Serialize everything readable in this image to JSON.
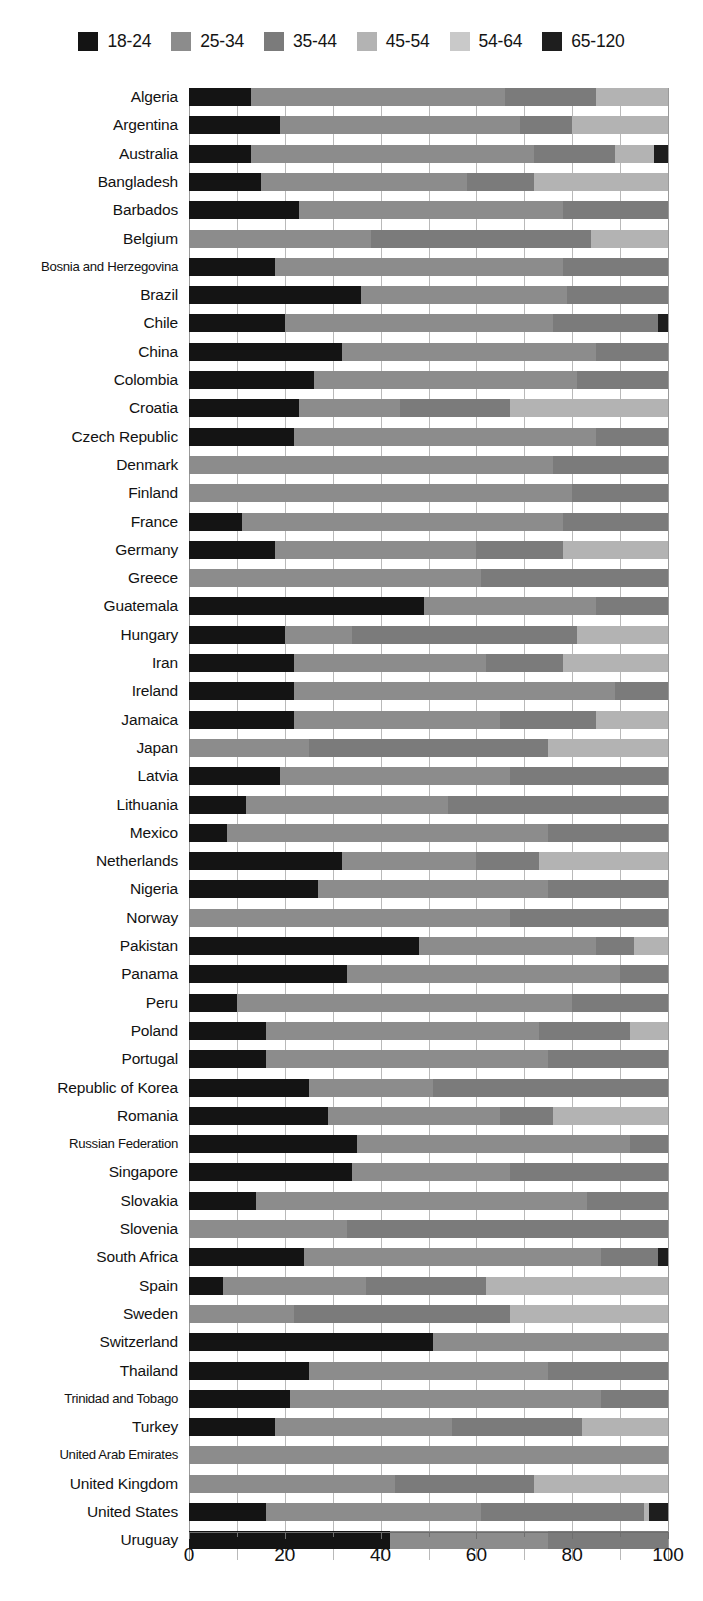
{
  "legend": {
    "position": "top-center",
    "entries": [
      {
        "label": "18-24",
        "color": "#141414",
        "icon": "legend-swatch-icon"
      },
      {
        "label": "25-34",
        "color": "#8c8c8c",
        "icon": "legend-swatch-icon"
      },
      {
        "label": "35-44",
        "color": "#7b7b7b",
        "icon": "legend-swatch-icon"
      },
      {
        "label": "45-54",
        "color": "#b3b3b3",
        "icon": "legend-swatch-icon"
      },
      {
        "label": "54-64",
        "color": "#c9c9c9",
        "icon": "legend-swatch-icon"
      },
      {
        "label": "65-120",
        "color": "#1e1e1e",
        "icon": "legend-swatch-icon"
      }
    ]
  },
  "axis": {
    "x_ticks": [
      "0",
      "20",
      "40",
      "60",
      "80",
      "100"
    ],
    "x_tick_values": [
      0,
      20,
      40,
      60,
      80,
      100
    ],
    "x_minor_values": [
      10,
      30,
      50,
      70,
      90
    ],
    "xlim": [
      0,
      100
    ],
    "xlabel": "",
    "ylabel": ""
  },
  "chart_data": {
    "type": "bar",
    "orientation": "horizontal",
    "stacked": true,
    "normalized": true,
    "title": "",
    "subtitle": "",
    "xlabel": "",
    "ylabel": "",
    "xlim": [
      0,
      100
    ],
    "grid": "vertical-minor-and-major",
    "legend_position": "top-center",
    "series": [
      {
        "name": "18-24",
        "color": "#141414"
      },
      {
        "name": "25-34",
        "color": "#8c8c8c"
      },
      {
        "name": "35-44",
        "color": "#7b7b7b"
      },
      {
        "name": "45-54",
        "color": "#b3b3b3"
      },
      {
        "name": "54-64",
        "color": "#c9c9c9"
      },
      {
        "name": "65-120",
        "color": "#1e1e1e"
      }
    ],
    "categories": [
      "Algeria",
      "Argentina",
      "Australia",
      "Bangladesh",
      "Barbados",
      "Belgium",
      "Bosnia and Herzegovina",
      "Brazil",
      "Chile",
      "China",
      "Colombia",
      "Croatia",
      "Czech Republic",
      "Denmark",
      "Finland",
      "France",
      "Germany",
      "Greece",
      "Guatemala",
      "Hungary",
      "Iran",
      "Ireland",
      "Jamaica",
      "Japan",
      "Latvia",
      "Lithuania",
      "Mexico",
      "Netherlands",
      "Nigeria",
      "Norway",
      "Pakistan",
      "Panama",
      "Peru",
      "Poland",
      "Portugal",
      "Republic of Korea",
      "Romania",
      "Russian Federation",
      "Singapore",
      "Slovakia",
      "Slovenia",
      "South Africa",
      "Spain",
      "Sweden",
      "Switzerland",
      "Thailand",
      "Trinidad and Tobago",
      "Turkey",
      "United Arab Emirates",
      "United Kingdom",
      "United States",
      "Uruguay"
    ],
    "rows": [
      {
        "category": "Algeria",
        "values": [
          13,
          53,
          19,
          15,
          0,
          0
        ]
      },
      {
        "category": "Argentina",
        "values": [
          19,
          50,
          11,
          20,
          0,
          0
        ]
      },
      {
        "category": "Australia",
        "values": [
          13,
          59,
          17,
          8,
          0,
          3
        ]
      },
      {
        "category": "Bangladesh",
        "values": [
          15,
          43,
          14,
          28,
          0,
          0
        ]
      },
      {
        "category": "Barbados",
        "values": [
          23,
          55,
          22,
          0,
          0,
          0
        ]
      },
      {
        "category": "Belgium",
        "values": [
          0,
          38,
          46,
          16,
          0,
          0
        ]
      },
      {
        "category": "Bosnia and Herzegovina",
        "values": [
          18,
          60,
          22,
          0,
          0,
          0
        ]
      },
      {
        "category": "Brazil",
        "values": [
          36,
          43,
          21,
          0,
          0,
          0
        ]
      },
      {
        "category": "Chile",
        "values": [
          20,
          56,
          22,
          0,
          0,
          2
        ]
      },
      {
        "category": "China",
        "values": [
          32,
          53,
          15,
          0,
          0,
          0
        ]
      },
      {
        "category": "Colombia",
        "values": [
          26,
          55,
          19,
          0,
          0,
          0
        ]
      },
      {
        "category": "Croatia",
        "values": [
          23,
          21,
          23,
          33,
          0,
          0
        ]
      },
      {
        "category": "Czech Republic",
        "values": [
          22,
          63,
          15,
          0,
          0,
          0
        ]
      },
      {
        "category": "Denmark",
        "values": [
          0,
          76,
          24,
          0,
          0,
          0
        ]
      },
      {
        "category": "Finland",
        "values": [
          0,
          80,
          20,
          0,
          0,
          0
        ]
      },
      {
        "category": "France",
        "values": [
          11,
          67,
          22,
          0,
          0,
          0
        ]
      },
      {
        "category": "Germany",
        "values": [
          18,
          42,
          18,
          22,
          0,
          0
        ]
      },
      {
        "category": "Greece",
        "values": [
          0,
          61,
          39,
          0,
          0,
          0
        ]
      },
      {
        "category": "Guatemala",
        "values": [
          49,
          36,
          15,
          0,
          0,
          0
        ]
      },
      {
        "category": "Hungary",
        "values": [
          20,
          14,
          47,
          19,
          0,
          0
        ]
      },
      {
        "category": "Iran",
        "values": [
          22,
          40,
          16,
          22,
          0,
          0
        ]
      },
      {
        "category": "Ireland",
        "values": [
          22,
          67,
          11,
          0,
          0,
          0
        ]
      },
      {
        "category": "Jamaica",
        "values": [
          22,
          43,
          20,
          15,
          0,
          0
        ]
      },
      {
        "category": "Japan",
        "values": [
          0,
          25,
          50,
          25,
          0,
          0
        ]
      },
      {
        "category": "Latvia",
        "values": [
          19,
          48,
          33,
          0,
          0,
          0
        ]
      },
      {
        "category": "Lithuania",
        "values": [
          12,
          42,
          46,
          0,
          0,
          0
        ]
      },
      {
        "category": "Mexico",
        "values": [
          8,
          67,
          25,
          0,
          0,
          0
        ]
      },
      {
        "category": "Netherlands",
        "values": [
          32,
          28,
          13,
          27,
          0,
          0
        ]
      },
      {
        "category": "Nigeria",
        "values": [
          27,
          48,
          25,
          0,
          0,
          0
        ]
      },
      {
        "category": "Norway",
        "values": [
          0,
          67,
          33,
          0,
          0,
          0
        ]
      },
      {
        "category": "Pakistan",
        "values": [
          48,
          37,
          8,
          7,
          0,
          0
        ]
      },
      {
        "category": "Panama",
        "values": [
          33,
          57,
          10,
          0,
          0,
          0
        ]
      },
      {
        "category": "Peru",
        "values": [
          10,
          70,
          20,
          0,
          0,
          0
        ]
      },
      {
        "category": "Poland",
        "values": [
          16,
          57,
          19,
          8,
          0,
          0
        ]
      },
      {
        "category": "Portugal",
        "values": [
          16,
          59,
          25,
          0,
          0,
          0
        ]
      },
      {
        "category": "Republic of Korea",
        "values": [
          25,
          26,
          49,
          0,
          0,
          0
        ]
      },
      {
        "category": "Romania",
        "values": [
          29,
          36,
          11,
          24,
          0,
          0
        ]
      },
      {
        "category": "Russian Federation",
        "values": [
          35,
          57,
          8,
          0,
          0,
          0
        ]
      },
      {
        "category": "Singapore",
        "values": [
          34,
          33,
          33,
          0,
          0,
          0
        ]
      },
      {
        "category": "Slovakia",
        "values": [
          14,
          69,
          17,
          0,
          0,
          0
        ]
      },
      {
        "category": "Slovenia",
        "values": [
          0,
          33,
          67,
          0,
          0,
          0
        ]
      },
      {
        "category": "South Africa",
        "values": [
          24,
          62,
          12,
          0,
          0,
          2
        ]
      },
      {
        "category": "Spain",
        "values": [
          7,
          30,
          25,
          38,
          0,
          0
        ]
      },
      {
        "category": "Sweden",
        "values": [
          0,
          22,
          45,
          33,
          0,
          0
        ]
      },
      {
        "category": "Switzerland",
        "values": [
          51,
          49,
          0,
          0,
          0,
          0
        ]
      },
      {
        "category": "Thailand",
        "values": [
          25,
          50,
          25,
          0,
          0,
          0
        ]
      },
      {
        "category": "Trinidad and Tobago",
        "values": [
          21,
          65,
          14,
          0,
          0,
          0
        ]
      },
      {
        "category": "Turkey",
        "values": [
          18,
          37,
          27,
          18,
          0,
          0
        ]
      },
      {
        "category": "United Arab Emirates",
        "values": [
          0,
          100,
          0,
          0,
          0,
          0
        ]
      },
      {
        "category": "United Kingdom",
        "values": [
          0,
          43,
          29,
          28,
          0,
          0
        ]
      },
      {
        "category": "United States",
        "values": [
          16,
          45,
          34,
          1,
          0,
          4
        ]
      },
      {
        "category": "Uruguay",
        "values": [
          42,
          33,
          25,
          0,
          0,
          0
        ]
      }
    ]
  }
}
